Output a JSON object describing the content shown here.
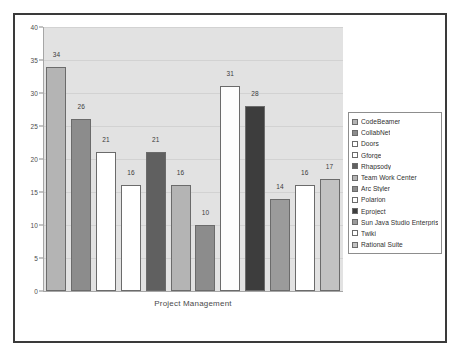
{
  "chart_data": {
    "type": "bar",
    "title": "",
    "xlabel": "Project Management",
    "ylabel": "",
    "ylim": [
      0,
      40
    ],
    "ytick_values": [
      0,
      5,
      10,
      15,
      20,
      25,
      30,
      35,
      40
    ],
    "ytick_labels": [
      "0",
      "5",
      "10",
      "15",
      "20",
      "25",
      "30",
      "35",
      "40"
    ],
    "grid": true,
    "legend_position": "right",
    "categories": [
      "CodeBeamer",
      "CollabNet",
      "Doors",
      "Gforge",
      "Rhapsody",
      "Team Work Center",
      "Arc Styler",
      "Polarion",
      "Eproject",
      "Sun Java Studio Enterprise",
      "Twiki",
      "Rational Suite"
    ],
    "values": [
      34,
      26,
      21,
      16,
      21,
      16,
      10,
      31,
      28,
      14,
      16,
      17
    ],
    "value_labels": [
      "34",
      "26",
      "21",
      "16",
      "21",
      "16",
      "10",
      "31",
      "28",
      "14",
      "16",
      "17"
    ],
    "colors": [
      "#b4b4b4",
      "#8c8c8c",
      "#ffffff",
      "#ffffff",
      "#606060",
      "#b4b4b4",
      "#8c8c8c",
      "#fdfdfd",
      "#3d3d3d",
      "#9b9b9b",
      "#ffffff",
      "#c2c2c2"
    ],
    "plot_background": "#e2e2e2"
  },
  "legend": {
    "items": [
      {
        "label": "CodeBeamer",
        "color": "#b4b4b4"
      },
      {
        "label": "CollabNet",
        "color": "#8c8c8c"
      },
      {
        "label": "Doors",
        "color": "#ffffff"
      },
      {
        "label": "Gforge",
        "color": "#ffffff"
      },
      {
        "label": "Rhapsody",
        "color": "#606060"
      },
      {
        "label": "Team Work Center",
        "color": "#b4b4b4"
      },
      {
        "label": "Arc Styler",
        "color": "#8c8c8c"
      },
      {
        "label": "Polarion",
        "color": "#fdfdfd"
      },
      {
        "label": "Eproject",
        "color": "#3d3d3d"
      },
      {
        "label": "Sun Java Studio Enterprise",
        "color": "#9b9b9b"
      },
      {
        "label": "Twiki",
        "color": "#ffffff"
      },
      {
        "label": "Rational Suite",
        "color": "#c2c2c2"
      }
    ]
  }
}
